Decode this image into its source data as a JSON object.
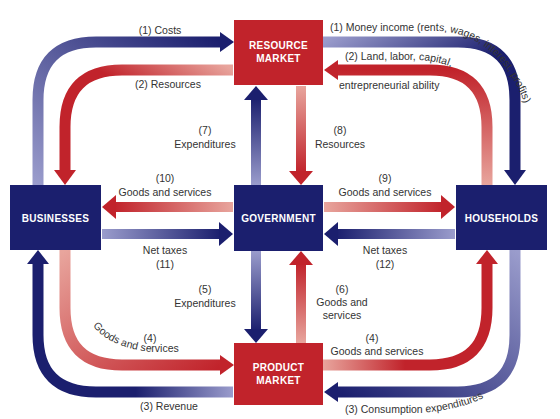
{
  "colors": {
    "navy": "#1b1f6e",
    "navy_light": "#9a9ccc",
    "red": "#c1232b",
    "red_light": "#e8a59d",
    "text": "#333333",
    "box_text": "#ffffff"
  },
  "boxes": {
    "resource_market": {
      "line1": "RESOURCE",
      "line2": "MARKET"
    },
    "product_market": {
      "line1": "PRODUCT",
      "line2": "MARKET"
    },
    "businesses": {
      "label": "BUSINESSES"
    },
    "government": {
      "label": "GOVERNMENT"
    },
    "households": {
      "label": "HOUSEHOLDS"
    }
  },
  "flows": {
    "f1_costs": "(1) Costs",
    "f1_money_income": "(1) Money income (rents, wages, interest, profits)",
    "f2_resources": "(2) Resources",
    "f2_land_line1": "(2) Land, labor, capital,",
    "f2_land_line2": "entrepreneurial ability",
    "f3_revenue": "(3) Revenue",
    "f3_consumption": "(3) Consumption expenditures",
    "f4_left_num": "(4)",
    "f4_left_text": "Goods and services",
    "f4_right_num": "(4)",
    "f4_right_text": "Goods and services",
    "f5_num": "(5)",
    "f5_text": "Expenditures",
    "f6_num": "(6)",
    "f6_line1": "Goods and",
    "f6_line2": "services",
    "f7_num": "(7)",
    "f7_text": "Expenditures",
    "f8_num": "(8)",
    "f8_text": "Resources",
    "f9_num": "(9)",
    "f9_text": "Goods and services",
    "f10_num": "(10)",
    "f10_text": "Goods and services",
    "f11_text": "Net taxes",
    "f11_num": "(11)",
    "f12_text": "Net taxes",
    "f12_num": "(12)"
  }
}
